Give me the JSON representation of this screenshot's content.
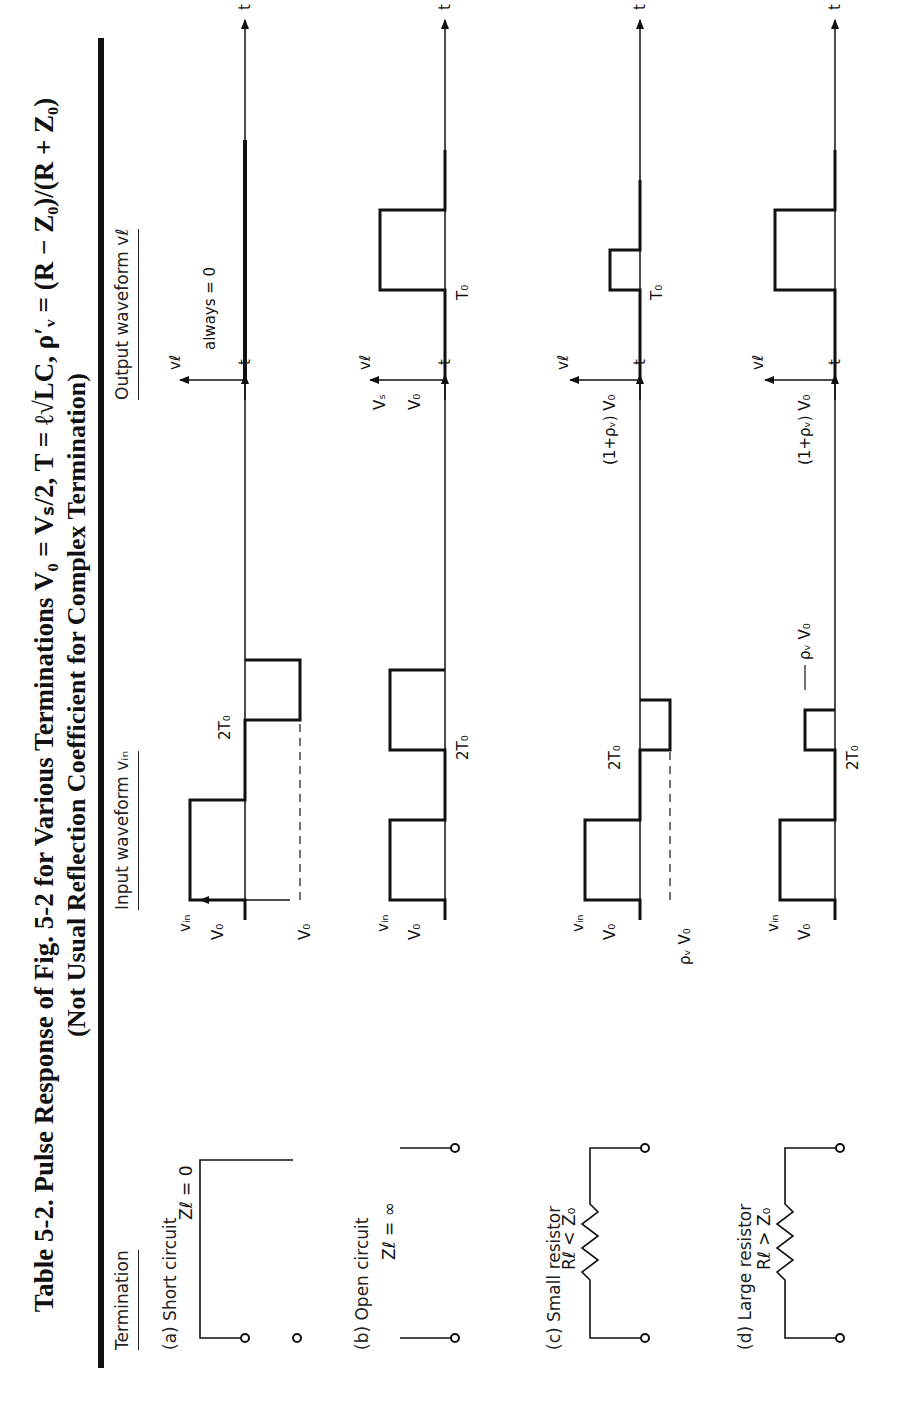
{
  "caption": {
    "line1": "Table 5-2.   Pulse Response of Fig. 5-2 for Various Terminations V₀ = Vₛ/2, T = ℓ√LC, ρ′ᵥ = (R − Z₀)/(R + Z₀)",
    "line2": "(Not Usual Reflection Coefficient for Complex Termination)"
  },
  "columns": {
    "termination": "Termination",
    "input": "Input waveform  vᵢₙ",
    "output": "Output waveform  vℓ"
  },
  "rows": [
    {
      "label": "(a)  Short circuit",
      "element": "Zℓ = 0",
      "input_labels": {
        "axis": "vᵢₙ",
        "level": "V₀",
        "neg_level": "V₀",
        "time": "2T₀",
        "t": "t"
      },
      "output_labels": {
        "axis": "vℓ",
        "note": "always = 0",
        "t": "t"
      }
    },
    {
      "label": "(b)  Open circuit",
      "element": "Zℓ = ∞",
      "input_labels": {
        "axis": "vᵢₙ",
        "level": "V₀",
        "time": "2T₀",
        "t": "t"
      },
      "output_labels": {
        "axis": "vℓ",
        "level1": "Vₛ",
        "level2": "V₀",
        "time": "T₀",
        "t": "t"
      }
    },
    {
      "label": "(c)  Small resistor",
      "element": "Rℓ < Z₀",
      "input_labels": {
        "axis": "vᵢₙ",
        "level": "V₀",
        "neg_level": "ρᵥ V₀",
        "time": "2T₀",
        "t": "t"
      },
      "output_labels": {
        "axis": "vℓ",
        "level": "(1+ρᵥ) V₀",
        "time": "T₀",
        "t": "t"
      }
    },
    {
      "label": "(d)  Large resistor",
      "element": "Rℓ > Z₀",
      "input_labels": {
        "axis": "vᵢₙ",
        "level": "V₀",
        "pos_level": "ρᵥ V₀",
        "time": "2T₀",
        "t": "t"
      },
      "output_labels": {
        "axis": "vℓ",
        "level": "(1+ρᵥ) V₀",
        "t": "t"
      }
    }
  ]
}
